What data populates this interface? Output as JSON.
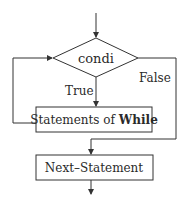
{
  "diagram": {
    "type": "flowchart",
    "nodes": {
      "condition": {
        "shape": "diamond",
        "label": "condi"
      },
      "body": {
        "shape": "rectangle",
        "label_prefix": "Statements of ",
        "label_bold": "While"
      },
      "next": {
        "shape": "rectangle",
        "label": "Next–Statement"
      }
    },
    "edges": {
      "true_label": "True",
      "false_label": "False"
    },
    "colors": {
      "line": "#333333",
      "text": "#2a2a2a",
      "background": "#ffffff"
    }
  }
}
